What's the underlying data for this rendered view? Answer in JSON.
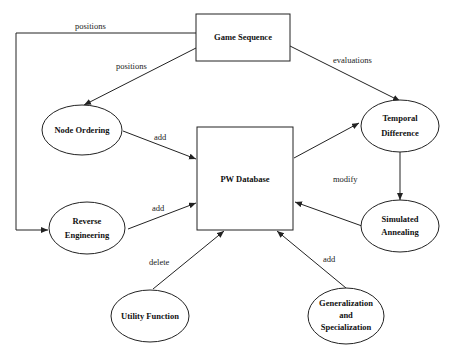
{
  "diagram": {
    "nodes": {
      "game_sequence": {
        "label": "Game Sequence",
        "shape": "rect"
      },
      "pw_database": {
        "label": "PW Database",
        "shape": "rect"
      },
      "node_ordering": {
        "label": "Node Ordering",
        "shape": "ellipse"
      },
      "temporal_difference": {
        "line1": "Temporal",
        "line2": "Difference",
        "shape": "ellipse"
      },
      "reverse_engineering": {
        "line1": "Reverse",
        "line2": "Engineering",
        "shape": "ellipse"
      },
      "simulated_annealing": {
        "line1": "Simulated",
        "line2": "Annealing",
        "shape": "ellipse"
      },
      "utility_function": {
        "label": "Utility Function",
        "shape": "ellipse"
      },
      "generalization": {
        "line1": "Generalization",
        "line2": "and",
        "line3": "Specialization",
        "shape": "ellipse"
      }
    },
    "edges": {
      "gs_to_re": {
        "label": "positions",
        "from": "Game Sequence",
        "to": "Reverse Engineering"
      },
      "gs_to_no": {
        "label": "positions",
        "from": "Game Sequence",
        "to": "Node Ordering"
      },
      "gs_to_td": {
        "label": "evaluations",
        "from": "Game Sequence",
        "to": "Temporal Difference"
      },
      "no_to_db": {
        "label": "add",
        "from": "Node Ordering",
        "to": "PW Database"
      },
      "re_to_db": {
        "label": "add",
        "from": "Reverse Engineering",
        "to": "PW Database"
      },
      "db_to_td": {
        "label": "",
        "from": "PW Database",
        "to": "Temporal Difference"
      },
      "td_to_sa": {
        "label": "modify",
        "from": "Temporal Difference",
        "to": "Simulated Annealing"
      },
      "sa_to_db": {
        "label": "",
        "from": "Simulated Annealing",
        "to": "PW Database"
      },
      "uf_to_db": {
        "label": "delete",
        "from": "Utility Function",
        "to": "PW Database"
      },
      "gen_to_db": {
        "label": "add",
        "from": "Generalization and Specialization",
        "to": "PW Database"
      }
    }
  }
}
